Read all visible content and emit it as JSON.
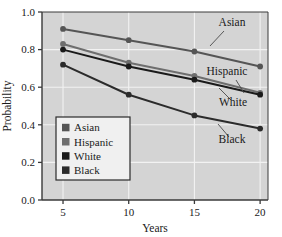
{
  "figure": {
    "background_color": "#ffffff",
    "plot_background_color": "#d4d4d4",
    "grid_color": "#f2f2f2",
    "frame_color": "#3a3a3a"
  },
  "chart_data": {
    "type": "line",
    "title": "",
    "xlabel": "Years",
    "ylabel": "Probability",
    "x": [
      5,
      10,
      15,
      20
    ],
    "xlim": [
      3.4,
      20.6
    ],
    "ylim": [
      0.0,
      1.0
    ],
    "xticks": [
      5,
      10,
      15,
      20
    ],
    "xtick_labels": [
      "5",
      "10",
      "15",
      "20"
    ],
    "yticks": [
      0.0,
      0.2,
      0.4,
      0.6,
      0.8,
      1.0
    ],
    "ytick_labels": [
      "0.0",
      "0.2",
      "0.4",
      "0.6",
      "0.8",
      "1.0"
    ],
    "grid": true,
    "legend_position": "lower-left-inside",
    "series": [
      {
        "name": "Asian",
        "color": "#555555",
        "marker": "circle",
        "values": [
          0.91,
          0.85,
          0.79,
          0.71
        ],
        "annotation": "Asian"
      },
      {
        "name": "Hispanic",
        "color": "#6e6e6e",
        "marker": "circle",
        "values": [
          0.83,
          0.73,
          0.66,
          0.57
        ],
        "annotation": "Hispanic"
      },
      {
        "name": "White",
        "color": "#1a1a1a",
        "marker": "circle",
        "values": [
          0.8,
          0.71,
          0.64,
          0.56
        ],
        "annotation": "White"
      },
      {
        "name": "Black",
        "color": "#2b2b2b",
        "marker": "circle",
        "values": [
          0.72,
          0.56,
          0.45,
          0.38
        ],
        "annotation": "Black"
      }
    ]
  },
  "legend": {
    "items": [
      {
        "label": "Asian",
        "color": "#555555"
      },
      {
        "label": "Hispanic",
        "color": "#6e6e6e"
      },
      {
        "label": "White",
        "color": "#1a1a1a"
      },
      {
        "label": "Black",
        "color": "#2b2b2b"
      }
    ]
  },
  "annotations": [
    {
      "text": "Asian",
      "x": 232,
      "y": 26,
      "leader": {
        "x1": 224,
        "y1": 31,
        "x2": 210,
        "y2": 46
      }
    },
    {
      "text": "Hispanic",
      "x": 227,
      "y": 75,
      "leader": {
        "x1": 236,
        "y1": 80,
        "x2": 244,
        "y2": 93
      }
    },
    {
      "text": "White",
      "x": 233,
      "y": 106,
      "leader": {
        "x1": 231,
        "y1": 100,
        "x2": 219,
        "y2": 88
      }
    },
    {
      "text": "Black",
      "x": 232,
      "y": 143,
      "leader": {
        "x1": 229,
        "y1": 137,
        "x2": 218,
        "y2": 124
      }
    }
  ]
}
